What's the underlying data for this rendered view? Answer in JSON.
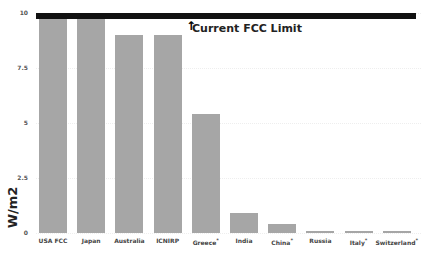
{
  "chart_data": {
    "type": "bar",
    "title": "",
    "xlabel": "",
    "ylabel": "W/m2",
    "ylim": [
      0,
      10
    ],
    "yticks": [
      "0",
      "2.5",
      "5",
      "7.5",
      "10"
    ],
    "grid": true,
    "categories": [
      "USA FCC",
      "Japan",
      "Australia",
      "ICNIRP",
      "Greece*",
      "India",
      "China*",
      "Russia",
      "Italy*",
      "Switzerland*"
    ],
    "values": [
      10,
      10,
      9,
      9,
      5.4,
      0.9,
      0.4,
      0.1,
      0.1,
      0.1
    ],
    "bar_color": "#a6a6a6",
    "annotations": [
      {
        "text": "Current FCC Limit",
        "type": "horizontal-line",
        "y": 10,
        "color": "#111111"
      }
    ]
  },
  "labels": {
    "ylabel": "W/m2",
    "annotation": "Current FCC Limit",
    "arrow": "↑"
  }
}
